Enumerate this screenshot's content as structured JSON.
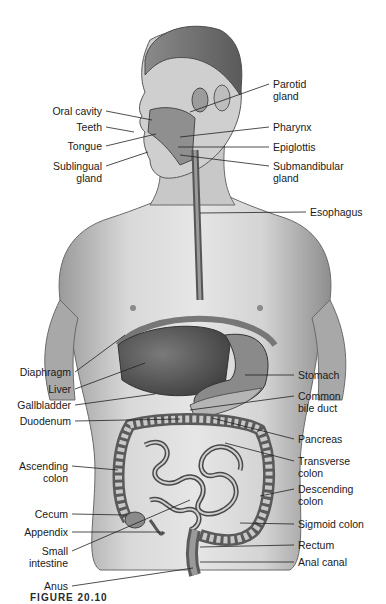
{
  "figure": {
    "caption": "FIGURE 20.10"
  },
  "labels_left": [
    {
      "id": "oral-cavity",
      "text": "Oral cavity",
      "x": 106,
      "y": 111,
      "tx": 152,
      "ty": 120
    },
    {
      "id": "teeth",
      "text": "Teeth",
      "x": 106,
      "y": 127,
      "tx": 134,
      "ty": 132
    },
    {
      "id": "tongue",
      "text": "Tongue",
      "x": 106,
      "y": 146,
      "tx": 156,
      "ty": 134
    },
    {
      "id": "sublingual-gland",
      "text": "Sublingual\ngland",
      "x": 106,
      "y": 166,
      "tx": 148,
      "ty": 152
    },
    {
      "id": "diaphragm",
      "text": "Diaphragm",
      "x": 75,
      "y": 372,
      "tx": 125,
      "ty": 335
    },
    {
      "id": "liver",
      "text": "Liver",
      "x": 75,
      "y": 389,
      "tx": 145,
      "ty": 363
    },
    {
      "id": "gallbladder",
      "text": "Gallbladder",
      "x": 75,
      "y": 405,
      "tx": 155,
      "ty": 394
    },
    {
      "id": "duodenum",
      "text": "Duodenum",
      "x": 75,
      "y": 421,
      "tx": 180,
      "ty": 419
    },
    {
      "id": "ascending-colon",
      "text": "Ascending\ncolon",
      "x": 72,
      "y": 466,
      "tx": 118,
      "ty": 470
    },
    {
      "id": "cecum",
      "text": "Cecum",
      "x": 72,
      "y": 514,
      "tx": 127,
      "ty": 515
    },
    {
      "id": "appendix",
      "text": "Appendix",
      "x": 72,
      "y": 532,
      "tx": 163,
      "ty": 532
    },
    {
      "id": "small-intestine",
      "text": "Small\nintestine",
      "x": 72,
      "y": 551,
      "tx": 190,
      "ty": 500
    },
    {
      "id": "anus",
      "text": "Anus",
      "x": 72,
      "y": 586,
      "tx": 193,
      "ty": 568
    }
  ],
  "labels_right": [
    {
      "id": "parotid-gland",
      "text": "Parotid\ngland",
      "x": 273,
      "y": 84,
      "tx": 190,
      "ty": 112
    },
    {
      "id": "pharynx",
      "text": "Pharynx",
      "x": 273,
      "y": 127,
      "tx": 180,
      "ty": 137
    },
    {
      "id": "epiglottis",
      "text": "Epiglottis",
      "x": 273,
      "y": 147,
      "tx": 178,
      "ty": 147
    },
    {
      "id": "submandibular-gland",
      "text": "Submandibular\ngland",
      "x": 273,
      "y": 166,
      "tx": 180,
      "ty": 155
    },
    {
      "id": "esophagus",
      "text": "Esophagus",
      "x": 310,
      "y": 212,
      "tx": 200,
      "ty": 213
    },
    {
      "id": "stomach",
      "text": "Stomach",
      "x": 298,
      "y": 375,
      "tx": 245,
      "ty": 375
    },
    {
      "id": "common-bile-duct",
      "text": "Common\nbile duct",
      "x": 298,
      "y": 396,
      "tx": 190,
      "ty": 410
    },
    {
      "id": "pancreas",
      "text": "Pancreas",
      "x": 298,
      "y": 439,
      "tx": 212,
      "ty": 418
    },
    {
      "id": "transverse-colon",
      "text": "Transverse\ncolon",
      "x": 298,
      "y": 461,
      "tx": 225,
      "ty": 443
    },
    {
      "id": "descending-colon",
      "text": "Descending\ncolon",
      "x": 298,
      "y": 489,
      "tx": 260,
      "ty": 496
    },
    {
      "id": "sigmoid-colon",
      "text": "Sigmoid colon",
      "x": 298,
      "y": 524,
      "tx": 240,
      "ty": 523
    },
    {
      "id": "rectum",
      "text": "Rectum",
      "x": 298,
      "y": 545,
      "tx": 200,
      "ty": 547
    },
    {
      "id": "anal-canal",
      "text": "Anal canal",
      "x": 298,
      "y": 562,
      "tx": 200,
      "ty": 562
    }
  ]
}
